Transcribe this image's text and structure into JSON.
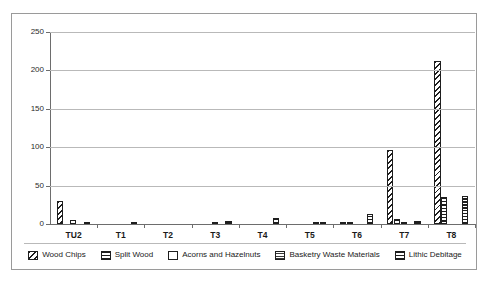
{
  "chart_data": {
    "type": "bar",
    "title": "",
    "xlabel": "",
    "ylabel": "",
    "ylim": [
      0,
      250
    ],
    "yticks": [
      0,
      50,
      100,
      150,
      200,
      250
    ],
    "grid": true,
    "legend_position": "bottom",
    "categories": [
      "TU2",
      "T1",
      "T2",
      "T3",
      "T4",
      "T5",
      "T6",
      "T7",
      "T8"
    ],
    "series": [
      {
        "name": "Wood Chips",
        "pattern": "diagonal-hatch",
        "values": [
          30,
          0,
          0,
          0,
          0,
          0,
          1,
          97,
          212
        ]
      },
      {
        "name": "Split Wood",
        "pattern": "horizontal-lines",
        "values": [
          0,
          0,
          0,
          0,
          0,
          0,
          1,
          6,
          35
        ]
      },
      {
        "name": "Acorns and Hazelnuts",
        "pattern": "light-dots",
        "values": [
          5,
          0,
          0,
          2,
          0,
          0,
          0,
          2,
          0
        ]
      },
      {
        "name": "Basketry Waste Materials",
        "pattern": "fine-grid",
        "values": [
          0,
          0,
          0,
          0,
          0,
          1,
          0,
          0,
          0
        ]
      },
      {
        "name": "Lithic Debitage",
        "pattern": "dense-checker",
        "values": [
          3,
          2,
          0,
          4,
          8,
          1,
          13,
          4,
          37
        ]
      }
    ]
  },
  "legend": {
    "items": [
      {
        "label": "Wood Chips"
      },
      {
        "label": "Split Wood"
      },
      {
        "label": "Acorns and Hazelnuts"
      },
      {
        "label": "Basketry Waste Materials"
      },
      {
        "label": "Lithic Debitage"
      }
    ]
  },
  "colors": {
    "ink": "#1e1e1e",
    "gridline": "#b9b9b9",
    "axis": "#6d6d6d",
    "frame": "#9a9a9a",
    "background": "#ffffff"
  }
}
